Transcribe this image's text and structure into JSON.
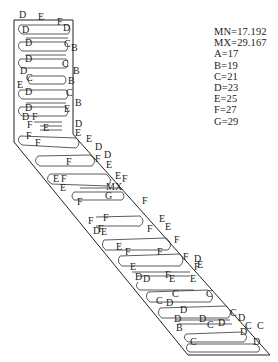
{
  "chart_data": {
    "type": "contour",
    "title": "",
    "min_label": "MN=17.192",
    "max_label": "MX=29.167",
    "min_value": 17.192,
    "max_value": 29.167,
    "levels": [
      {
        "key": "A",
        "value": 17,
        "text": "A=17"
      },
      {
        "key": "B",
        "value": 19,
        "text": "B=19"
      },
      {
        "key": "C",
        "value": 21,
        "text": "C=21"
      },
      {
        "key": "D",
        "value": 23,
        "text": "D=23"
      },
      {
        "key": "E",
        "value": 25,
        "text": "E=25"
      },
      {
        "key": "F",
        "value": 27,
        "text": "F=27"
      },
      {
        "key": "G",
        "value": 29,
        "text": "G=29"
      }
    ],
    "max_marker": "MX",
    "legend_position": "top-right",
    "grid": false,
    "contour_labels": [
      {
        "t": "D",
        "x": 19,
        "y": 18
      },
      {
        "t": "E",
        "x": 38,
        "y": 20
      },
      {
        "t": "F",
        "x": 57,
        "y": 25
      },
      {
        "t": "D",
        "x": 63,
        "y": 31
      },
      {
        "t": "D",
        "x": 22,
        "y": 33
      },
      {
        "t": "D",
        "x": 25,
        "y": 46
      },
      {
        "t": "C",
        "x": 64,
        "y": 47
      },
      {
        "t": "B",
        "x": 71,
        "y": 51
      },
      {
        "t": "D",
        "x": 25,
        "y": 62
      },
      {
        "t": "C",
        "x": 62,
        "y": 67
      },
      {
        "t": "B",
        "x": 73,
        "y": 74
      },
      {
        "t": "D",
        "x": 20,
        "y": 74
      },
      {
        "t": "C",
        "x": 26,
        "y": 81
      },
      {
        "t": "B",
        "x": 68,
        "y": 84
      },
      {
        "t": "E",
        "x": 17,
        "y": 88
      },
      {
        "t": "D",
        "x": 25,
        "y": 95
      },
      {
        "t": "C",
        "x": 66,
        "y": 96
      },
      {
        "t": "B",
        "x": 75,
        "y": 106
      },
      {
        "t": "D",
        "x": 25,
        "y": 111
      },
      {
        "t": "E",
        "x": 64,
        "y": 112
      },
      {
        "t": "D",
        "x": 22,
        "y": 120
      },
      {
        "t": "F",
        "x": 32,
        "y": 120
      },
      {
        "t": "F",
        "x": 27,
        "y": 128
      },
      {
        "t": "E",
        "x": 43,
        "y": 131
      },
      {
        "t": "D",
        "x": 75,
        "y": 127
      },
      {
        "t": "E",
        "x": 75,
        "y": 136
      },
      {
        "t": "F",
        "x": 26,
        "y": 139
      },
      {
        "t": "F",
        "x": 35,
        "y": 146
      },
      {
        "t": "E",
        "x": 86,
        "y": 142
      },
      {
        "t": "D",
        "x": 95,
        "y": 150
      },
      {
        "t": "D",
        "x": 104,
        "y": 158
      },
      {
        "t": "F",
        "x": 66,
        "y": 165
      },
      {
        "t": "F",
        "x": 95,
        "y": 162
      },
      {
        "t": "E",
        "x": 106,
        "y": 168
      },
      {
        "t": "E",
        "x": 115,
        "y": 179
      },
      {
        "t": "F",
        "x": 122,
        "y": 182
      },
      {
        "t": "E",
        "x": 53,
        "y": 182
      },
      {
        "t": "F",
        "x": 61,
        "y": 182
      },
      {
        "t": "E",
        "x": 60,
        "y": 191
      },
      {
        "t": "MX",
        "x": 106,
        "y": 190
      },
      {
        "t": "G",
        "x": 105,
        "y": 199
      },
      {
        "t": "F",
        "x": 77,
        "y": 205
      },
      {
        "t": "F",
        "x": 142,
        "y": 204
      },
      {
        "t": "E",
        "x": 159,
        "y": 222
      },
      {
        "t": "E",
        "x": 165,
        "y": 230
      },
      {
        "t": "F",
        "x": 88,
        "y": 224
      },
      {
        "t": "F",
        "x": 103,
        "y": 221
      },
      {
        "t": "F",
        "x": 98,
        "y": 232
      },
      {
        "t": "D",
        "x": 93,
        "y": 234
      },
      {
        "t": "E",
        "x": 101,
        "y": 235
      },
      {
        "t": "F",
        "x": 147,
        "y": 232
      },
      {
        "t": "F",
        "x": 174,
        "y": 243
      },
      {
        "t": "E",
        "x": 116,
        "y": 250
      },
      {
        "t": "F",
        "x": 125,
        "y": 255
      },
      {
        "t": "F",
        "x": 157,
        "y": 255
      },
      {
        "t": "F",
        "x": 183,
        "y": 260
      },
      {
        "t": "D",
        "x": 194,
        "y": 262
      },
      {
        "t": "E",
        "x": 130,
        "y": 270
      },
      {
        "t": "F",
        "x": 194,
        "y": 270
      },
      {
        "t": "E",
        "x": 197,
        "y": 268
      },
      {
        "t": "D",
        "x": 135,
        "y": 280
      },
      {
        "t": "D",
        "x": 143,
        "y": 282
      },
      {
        "t": "F",
        "x": 165,
        "y": 278
      },
      {
        "t": "E",
        "x": 169,
        "y": 282
      },
      {
        "t": "E",
        "x": 190,
        "y": 282
      },
      {
        "t": "C",
        "x": 172,
        "y": 297
      },
      {
        "t": "C",
        "x": 206,
        "y": 297
      },
      {
        "t": "C",
        "x": 156,
        "y": 304
      },
      {
        "t": "D",
        "x": 166,
        "y": 306
      },
      {
        "t": "D",
        "x": 180,
        "y": 313
      },
      {
        "t": "C",
        "x": 230,
        "y": 316
      },
      {
        "t": "D",
        "x": 238,
        "y": 321
      },
      {
        "t": "D",
        "x": 174,
        "y": 322
      },
      {
        "t": "D",
        "x": 199,
        "y": 322
      },
      {
        "t": "D",
        "x": 218,
        "y": 326
      },
      {
        "t": "C",
        "x": 207,
        "y": 328
      },
      {
        "t": "C",
        "x": 245,
        "y": 329
      },
      {
        "t": "C",
        "x": 257,
        "y": 329
      },
      {
        "t": "B",
        "x": 176,
        "y": 331
      },
      {
        "t": "D",
        "x": 240,
        "y": 335
      },
      {
        "t": "C",
        "x": 190,
        "y": 345
      },
      {
        "t": "D",
        "x": 253,
        "y": 345
      }
    ]
  }
}
